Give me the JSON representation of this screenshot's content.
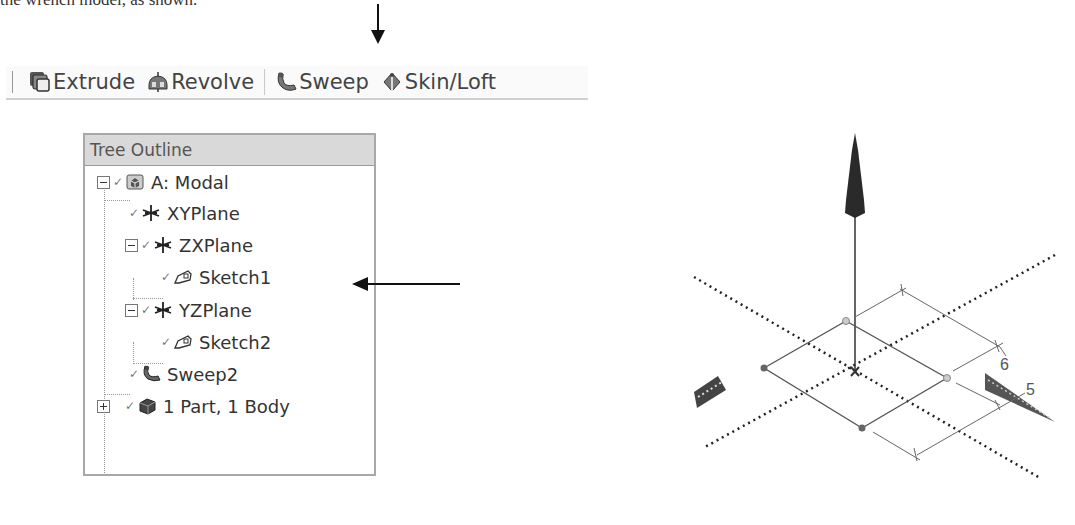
{
  "caption": {
    "text": "the wrench model, as shown."
  },
  "toolbar": {
    "buttons": [
      {
        "label": "Extrude",
        "icon": "extrude-icon"
      },
      {
        "label": "Revolve",
        "icon": "revolve-icon"
      },
      {
        "label": "Sweep",
        "icon": "sweep-icon"
      },
      {
        "label": "Skin/Loft",
        "icon": "skin-loft-icon"
      }
    ],
    "highlighted": "Sweep"
  },
  "tree": {
    "title": "Tree Outline",
    "items": [
      {
        "label": "A: Modal",
        "icon": "model-icon",
        "level": 0,
        "toggle": "minus"
      },
      {
        "label": "XYPlane",
        "icon": "plane-icon",
        "level": 1,
        "toggle": null
      },
      {
        "label": "ZXPlane",
        "icon": "plane-icon",
        "level": 1,
        "toggle": "minus"
      },
      {
        "label": "Sketch1",
        "icon": "sketch-icon",
        "level": 2,
        "toggle": null,
        "pointed": true
      },
      {
        "label": "YZPlane",
        "icon": "plane-icon",
        "level": 1,
        "toggle": "minus"
      },
      {
        "label": "Sketch2",
        "icon": "sketch-icon",
        "level": 2,
        "toggle": null
      },
      {
        "label": "Sweep2",
        "icon": "sweep-icon",
        "level": 1,
        "toggle": null
      },
      {
        "label": "1 Part, 1 Body",
        "icon": "body-icon",
        "level": 1,
        "toggle": "plus"
      }
    ]
  },
  "viewport": {
    "dimensions": [
      {
        "label": "6"
      },
      {
        "label": "5"
      }
    ]
  },
  "colors": {
    "toolbar_bg": "#fafafa",
    "tree_header_bg": "#d9d9d9",
    "axis_dark": "#222222"
  }
}
